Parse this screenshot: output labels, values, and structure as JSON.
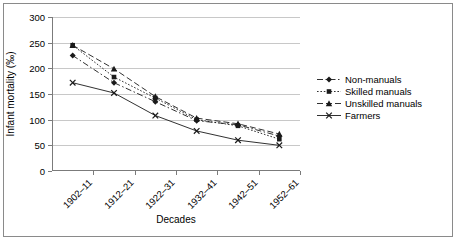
{
  "chart_data": {
    "type": "line",
    "title": "",
    "xlabel": "Decades",
    "ylabel": "Infant mortality (‰)",
    "categories": [
      "1902–11",
      "1912–21",
      "1922–31",
      "1932–41",
      "1942–51",
      "1952–61"
    ],
    "ylim": [
      0,
      300
    ],
    "ytick_values": [
      0,
      50,
      100,
      150,
      200,
      250,
      300
    ],
    "ytick_labels": [
      "0",
      "50",
      "100",
      "150",
      "200",
      "250",
      "300"
    ],
    "grid": "horizontal",
    "legend_position": "right-outside",
    "series": [
      {
        "name": "Non-manuals",
        "values": [
          225,
          172,
          135,
          98,
          90,
          68
        ],
        "marker": "diamond",
        "linestyle": "dash-dot",
        "color": "#1a1a1a"
      },
      {
        "name": "Skilled manuals",
        "values": [
          245,
          183,
          142,
          100,
          88,
          62
        ],
        "marker": "square",
        "linestyle": "dotted",
        "color": "#1a1a1a"
      },
      {
        "name": "Unskilled manuals",
        "values": [
          245,
          199,
          145,
          103,
          92,
          72
        ],
        "marker": "triangle",
        "linestyle": "dashed",
        "color": "#1a1a1a"
      },
      {
        "name": "Farmers",
        "values": [
          172,
          152,
          108,
          78,
          60,
          50
        ],
        "marker": "cross",
        "linestyle": "solid",
        "color": "#1a1a1a"
      }
    ]
  },
  "colors": {
    "background": "#ffffff",
    "frame": "#8a8a8a",
    "axis": "#7b7b7b",
    "gridline": "#c8c8c8",
    "ink": "#1a1a1a"
  }
}
